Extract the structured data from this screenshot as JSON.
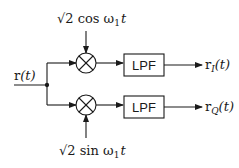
{
  "diagram": {
    "input": {
      "label_main": "r",
      "label_arg": "(t)"
    },
    "top": {
      "osc_sqrt": "√2",
      "osc_fn": " cos ",
      "osc_omega": "ω",
      "osc_sub": "1",
      "osc_t": "t",
      "filter_label": "LPF",
      "out_main": "r",
      "out_sub": "I",
      "out_arg": "(t)"
    },
    "bottom": {
      "osc_sqrt": "√2",
      "osc_fn": " sin ",
      "osc_omega": "ω",
      "osc_sub": "1",
      "osc_t": "t",
      "filter_label": "LPF",
      "out_main": "r",
      "out_sub": "Q",
      "out_arg": "(t)"
    },
    "colors": {
      "stroke": "#1a1a1a",
      "background": "#ffffff"
    }
  }
}
